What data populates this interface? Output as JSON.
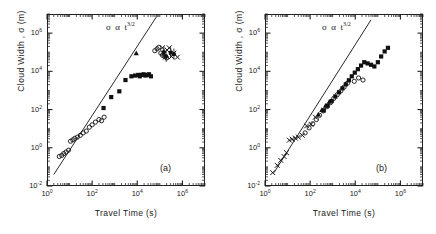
{
  "figure": {
    "caption_left": "(a)",
    "caption_right": "(b)"
  },
  "axes": {
    "xlabel": "Travel Time  (s)",
    "ylabel": "Cloud  Width ,  σ (m)",
    "xticks": [
      "10",
      "10",
      "10",
      "10"
    ],
    "xtick_exp": [
      "0",
      "2",
      "4",
      "6"
    ],
    "yticks": [
      "10",
      "10",
      "10",
      "10",
      "10"
    ],
    "ytick_exp": [
      "-2",
      "0",
      "2",
      "4",
      "6"
    ],
    "annotation_sigma": "σ",
    "annotation_prop": "α",
    "annotation_t": "t",
    "annotation_exp": "3/2"
  },
  "chart_data": [
    {
      "type": "scatter",
      "title": "(a)",
      "xlabel": "Travel Time (s)",
      "ylabel": "Cloud Width, σ (m)",
      "xscale": "log",
      "yscale": "log",
      "xlim": [
        1,
        10000000
      ],
      "ylim": [
        0.01,
        10000000
      ],
      "grid": false,
      "legend": "none",
      "annotation": "σ ∝ t^3/2",
      "reference_line": {
        "label": "σ ∝ t^(3/2)",
        "slope": 1.5,
        "x": [
          2,
          70000
        ],
        "y": [
          0.04,
          7000000
        ]
      },
      "series": [
        {
          "name": "open-circle",
          "marker": "open-circle",
          "x": [
            3.5,
            4.5,
            5.5,
            7,
            9,
            11,
            14,
            17,
            22,
            30,
            40,
            55,
            75,
            100,
            140,
            200,
            260,
            340,
            60000,
            75000,
            90000,
            110000,
            130000,
            160000,
            200000
          ],
          "y": [
            0.35,
            0.4,
            0.5,
            0.6,
            0.75,
            2.2,
            2.6,
            3.1,
            3.6,
            4.5,
            6.0,
            7.5,
            12,
            16,
            22,
            30,
            26,
            40,
            120000,
            150000,
            180000,
            90000,
            70000,
            60000,
            50000
          ]
        },
        {
          "name": "filled-square",
          "marker": "filled-square",
          "x": [
            320,
            700,
            1600,
            3000,
            5500,
            8000,
            11000,
            13000,
            16000,
            19000,
            23000,
            28000,
            33000,
            40000
          ],
          "y": [
            120,
            450,
            900,
            3500,
            5500,
            6000,
            6500,
            5500,
            6500,
            7000,
            6000,
            6500,
            7000,
            5500
          ]
        },
        {
          "name": "filled-triangle",
          "marker": "filled-triangle",
          "x": [
            9000
          ],
          "y": [
            90000
          ]
        },
        {
          "name": "cross-x",
          "marker": "cross-x",
          "x": [
            130000,
            150000,
            175000,
            210000,
            260000,
            330000,
            420000,
            600000
          ],
          "y": [
            170000,
            90000,
            55000,
            130000,
            170000,
            60000,
            90000,
            55000
          ]
        },
        {
          "name": "filled-circle-errorbar",
          "marker": "filled-circle",
          "x": [
            150000,
            190000,
            300000,
            420000
          ],
          "y": [
            100000,
            60000,
            95000,
            80000
          ]
        }
      ]
    },
    {
      "type": "scatter",
      "title": "(b)",
      "xlabel": "Travel Time (s)",
      "ylabel": "Cloud Width, σ (m)",
      "xscale": "log",
      "yscale": "log",
      "xlim": [
        1,
        10000000
      ],
      "ylim": [
        0.01,
        10000000
      ],
      "grid": false,
      "legend": "none",
      "annotation": "σ ∝ t^3/2",
      "reference_line": {
        "label": "σ ∝ t^(3/2)",
        "slope": 1.5,
        "x": [
          2.5,
          50000
        ],
        "y": [
          0.05,
          5000000
        ]
      },
      "series": [
        {
          "name": "cross-x",
          "marker": "cross-x",
          "x": [
            2.2,
            3.5,
            5,
            7,
            9,
            12,
            16,
            22,
            30,
            45,
            70,
            110,
            170
          ],
          "y": [
            0.05,
            0.12,
            0.22,
            0.35,
            0.55,
            2.5,
            2.8,
            3.2,
            3.6,
            4.5,
            14,
            17,
            40
          ]
        },
        {
          "name": "open-circle",
          "marker": "open-circle",
          "x": [
            60,
            90,
            130,
            190,
            260,
            380,
            550,
            800,
            1100,
            1600,
            2300,
            3200,
            4500,
            9000,
            14000,
            22000
          ],
          "y": [
            6,
            11,
            18,
            30,
            50,
            85,
            140,
            230,
            380,
            600,
            950,
            1500,
            2400,
            3000,
            4500,
            3500
          ]
        },
        {
          "name": "filled-square",
          "marker": "filled-square",
          "x": [
            400,
            600,
            900,
            1300,
            1900,
            2700,
            3800,
            5200,
            7000,
            9500,
            13000,
            18000,
            25000,
            35000,
            50000,
            70000,
            100000,
            140000,
            200000,
            280000
          ],
          "y": [
            90,
            160,
            280,
            480,
            800,
            1300,
            2100,
            3400,
            5500,
            8500,
            13000,
            20000,
            30000,
            26000,
            22000,
            18000,
            30000,
            60000,
            110000,
            170000
          ]
        },
        {
          "name": "filled-triangle",
          "marker": "filled-triangle",
          "x": [
            230,
            330,
            480,
            700
          ],
          "y": [
            55,
            95,
            160,
            260
          ]
        }
      ]
    }
  ]
}
